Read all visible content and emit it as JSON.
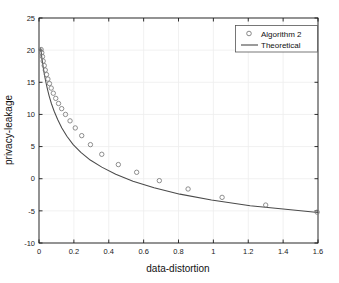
{
  "chart_data": {
    "type": "line",
    "title": "",
    "xlabel": "data-distortion",
    "ylabel": "privacy-leakage",
    "xlim": [
      0,
      1.6
    ],
    "ylim": [
      -10,
      25
    ],
    "xticks": [
      "0",
      "0.2",
      "0.4",
      "0.6",
      "0.8",
      "1",
      "1.2",
      "1.4",
      "1.6"
    ],
    "xtick_values": [
      0,
      0.2,
      0.4,
      0.6,
      0.8,
      1.0,
      1.2,
      1.4,
      1.6
    ],
    "yticks": [
      "25",
      "20",
      "15",
      "10",
      "5",
      "0",
      "-5",
      "-10"
    ],
    "ytick_values": [
      25,
      20,
      15,
      10,
      5,
      0,
      -5,
      -10
    ],
    "grid": true,
    "legend_position": "top-right",
    "series": [
      {
        "name": "Algorithm 2",
        "marker": "circle-open",
        "style": "markers",
        "color": "#7b7b7b",
        "x": [
          0.012,
          0.016,
          0.02,
          0.024,
          0.03,
          0.036,
          0.043,
          0.051,
          0.06,
          0.07,
          0.082,
          0.096,
          0.112,
          0.13,
          0.152,
          0.178,
          0.208,
          0.245,
          0.295,
          0.36,
          0.455,
          0.56,
          0.69,
          0.855,
          1.05,
          1.3,
          1.595
        ],
        "y": [
          20.1,
          19.6,
          19.0,
          18.3,
          17.6,
          16.9,
          16.2,
          15.5,
          14.8,
          14.1,
          13.3,
          12.5,
          11.7,
          10.9,
          10.0,
          9.0,
          7.9,
          6.7,
          5.3,
          3.8,
          2.2,
          1.0,
          -0.3,
          -1.6,
          -2.9,
          -4.1,
          -5.2
        ]
      },
      {
        "name": "Theoretical",
        "marker": "none",
        "style": "line",
        "color": "#4a4a4a",
        "x": [
          0.01,
          0.013,
          0.016,
          0.02,
          0.025,
          0.031,
          0.038,
          0.047,
          0.058,
          0.071,
          0.087,
          0.107,
          0.131,
          0.16,
          0.196,
          0.24,
          0.294,
          0.36,
          0.44,
          0.539,
          0.66,
          0.808,
          0.989,
          1.211,
          1.4,
          1.6
        ],
        "y": [
          20.3,
          19.6,
          18.9,
          18.1,
          17.2,
          16.2,
          15.2,
          14.1,
          12.9,
          11.7,
          10.5,
          9.2,
          7.9,
          6.6,
          5.3,
          4.1,
          2.9,
          1.8,
          0.7,
          -0.4,
          -1.4,
          -2.4,
          -3.3,
          -4.2,
          -4.7,
          -5.25
        ]
      }
    ]
  },
  "legend": {
    "items": [
      {
        "label": "Algorithm 2",
        "glyph": "circle-open-marker"
      },
      {
        "label": "Theoretical",
        "glyph": "solid-line-sample"
      }
    ]
  },
  "colors": {
    "axis": "#1a1a1a",
    "grid": "#ededed",
    "marker_stroke": "#7b7b7b",
    "line": "#4a4a4a",
    "background": "#ffffff",
    "legend_border": "#555555"
  }
}
